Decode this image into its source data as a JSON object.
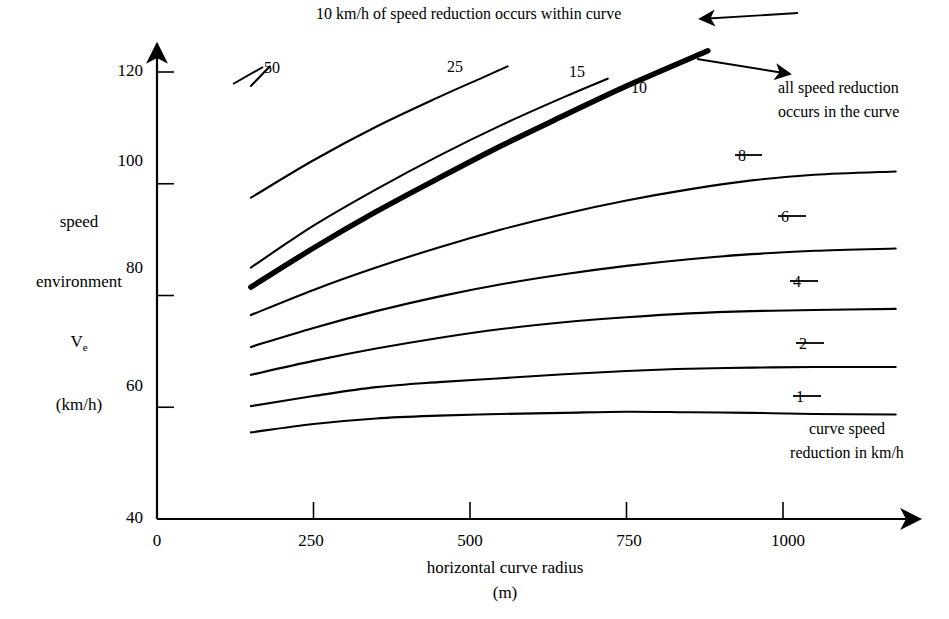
{
  "figure": {
    "background": "#ffffff",
    "ink": "#000000"
  },
  "axes": {
    "x": {
      "title_line1": "horizontal curve radius",
      "title_line2": "(m)",
      "ticks": [
        {
          "value": 0,
          "label": "0"
        },
        {
          "value": 250,
          "label": "250"
        },
        {
          "value": 500,
          "label": "500"
        },
        {
          "value": 750,
          "label": "750"
        },
        {
          "value": 1000,
          "label": "1000"
        }
      ],
      "range": [
        0,
        1180
      ]
    },
    "y": {
      "title_line1": "speed",
      "title_line2": "environment",
      "title_line3_main": "V",
      "title_line3_sub": "e",
      "title_line4": "(km/h)",
      "ticks": [
        {
          "value": 40,
          "label": "40"
        },
        {
          "value": 60,
          "label": "60"
        },
        {
          "value": 80,
          "label": "80"
        },
        {
          "value": 100,
          "label": "100"
        },
        {
          "value": 120,
          "label": "120"
        }
      ],
      "range": [
        40,
        126
      ]
    }
  },
  "annotations": {
    "top_note": "10 km/h of speed reduction occurs within curve",
    "right_note_line1": "all speed reduction",
    "right_note_line2": "occurs in the curve",
    "legend_caption_line1": "curve speed",
    "legend_caption_line2": "reduction in km/h"
  },
  "chart_data": {
    "type": "line",
    "title": "",
    "xlabel": "horizontal curve radius (m)",
    "ylabel": "speed environment Ve (km/h)",
    "xlim": [
      0,
      1180
    ],
    "ylim": [
      40,
      126
    ],
    "grid": false,
    "legend": "inline curve labels (curve speed reduction in km/h)",
    "series": [
      {
        "name": "50",
        "label": "50",
        "emphasis": "normal",
        "label_x": 258,
        "label_y": 116,
        "points": [
          [
            150,
            117.5
          ],
          [
            180,
            121.0
          ]
        ]
      },
      {
        "name": "25",
        "label": "25",
        "emphasis": "normal",
        "label_x": 740,
        "label_y": 123,
        "points": [
          [
            150,
            97.5
          ],
          [
            250,
            104.2
          ],
          [
            350,
            110.2
          ],
          [
            450,
            115.5
          ],
          [
            520,
            119.0
          ],
          [
            560,
            121.0
          ]
        ]
      },
      {
        "name": "15",
        "label": "15",
        "emphasis": "normal",
        "label_x": 1060,
        "label_y": 123,
        "points": [
          [
            150,
            85.0
          ],
          [
            250,
            92.5
          ],
          [
            350,
            99.0
          ],
          [
            450,
            105.0
          ],
          [
            550,
            110.5
          ],
          [
            650,
            115.5
          ],
          [
            720,
            118.8
          ]
        ]
      },
      {
        "name": "10",
        "label": "10",
        "emphasis": "bold",
        "label_x": 1130,
        "label_y": 118,
        "points": [
          [
            150,
            81.5
          ],
          [
            250,
            88.5
          ],
          [
            350,
            95.0
          ],
          [
            450,
            101.0
          ],
          [
            550,
            106.8
          ],
          [
            650,
            112.2
          ],
          [
            750,
            117.5
          ],
          [
            880,
            123.8
          ]
        ]
      },
      {
        "name": "8",
        "label": "8",
        "emphasis": "normal",
        "label_x": 1180,
        "label_y": 101,
        "points": [
          [
            150,
            76.5
          ],
          [
            250,
            81.0
          ],
          [
            350,
            85.0
          ],
          [
            450,
            88.6
          ],
          [
            550,
            91.8
          ],
          [
            650,
            94.6
          ],
          [
            750,
            97.0
          ],
          [
            850,
            99.0
          ],
          [
            950,
            100.6
          ],
          [
            1050,
            101.6
          ],
          [
            1180,
            102.2
          ]
        ]
      },
      {
        "name": "6",
        "label": "6",
        "emphasis": "normal",
        "label_x": 1180,
        "label_y": 88,
        "points": [
          [
            150,
            70.8
          ],
          [
            250,
            74.2
          ],
          [
            350,
            77.2
          ],
          [
            450,
            79.8
          ],
          [
            550,
            82.0
          ],
          [
            650,
            83.8
          ],
          [
            750,
            85.3
          ],
          [
            850,
            86.5
          ],
          [
            950,
            87.4
          ],
          [
            1050,
            88.0
          ],
          [
            1180,
            88.4
          ]
        ]
      },
      {
        "name": "4",
        "label": "4",
        "emphasis": "normal",
        "label_x": 1180,
        "label_y": 77,
        "points": [
          [
            150,
            65.8
          ],
          [
            250,
            68.3
          ],
          [
            350,
            70.5
          ],
          [
            450,
            72.4
          ],
          [
            550,
            74.0
          ],
          [
            650,
            75.2
          ],
          [
            750,
            76.1
          ],
          [
            850,
            76.8
          ],
          [
            950,
            77.2
          ],
          [
            1050,
            77.4
          ],
          [
            1180,
            77.6
          ]
        ]
      },
      {
        "name": "2",
        "label": "2",
        "emphasis": "normal",
        "label_x": 1180,
        "label_y": 67,
        "points": [
          [
            150,
            60.2
          ],
          [
            250,
            62.0
          ],
          [
            350,
            63.6
          ],
          [
            450,
            64.5
          ],
          [
            550,
            65.2
          ],
          [
            650,
            65.9
          ],
          [
            750,
            66.5
          ],
          [
            850,
            66.9
          ],
          [
            950,
            67.1
          ],
          [
            1050,
            67.2
          ],
          [
            1180,
            67.2
          ]
        ]
      },
      {
        "name": "1",
        "label": "1",
        "emphasis": "normal",
        "label_x": 1180,
        "label_y": 58,
        "points": [
          [
            150,
            55.5
          ],
          [
            250,
            57.0
          ],
          [
            350,
            58.0
          ],
          [
            450,
            58.5
          ],
          [
            550,
            58.8
          ],
          [
            650,
            59.0
          ],
          [
            750,
            59.2
          ],
          [
            850,
            59.1
          ],
          [
            950,
            59.0
          ],
          [
            1050,
            58.8
          ],
          [
            1180,
            58.7
          ]
        ]
      }
    ]
  }
}
